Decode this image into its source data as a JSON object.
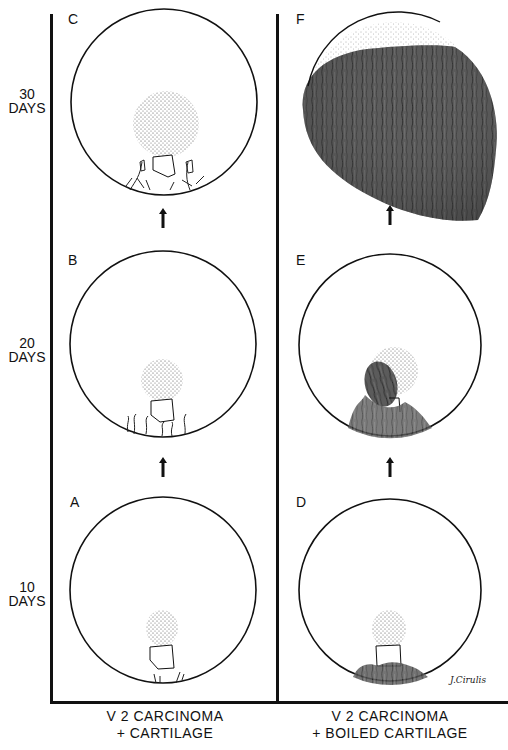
{
  "figure": {
    "rows": [
      {
        "time_label_num": "30",
        "time_label_unit": "DAYS"
      },
      {
        "time_label_num": "20",
        "time_label_unit": "DAYS"
      },
      {
        "time_label_num": "10",
        "time_label_unit": "DAYS"
      }
    ],
    "panels": {
      "A": "A",
      "B": "B",
      "C": "C",
      "D": "D",
      "E": "E",
      "F": "F"
    },
    "columns": [
      {
        "line1": "V 2  CARCINOMA",
        "line2": "+ CARTILAGE"
      },
      {
        "line1": "V 2  CARCINOMA",
        "line2": "+ BOILED CARTILAGE"
      }
    ],
    "signature": "J.Cirulis",
    "colors": {
      "ink": "#111111",
      "vascular_dark": "#3a3a3a",
      "vascular_mid": "#5a5a5a",
      "stipple": "#444444"
    }
  }
}
